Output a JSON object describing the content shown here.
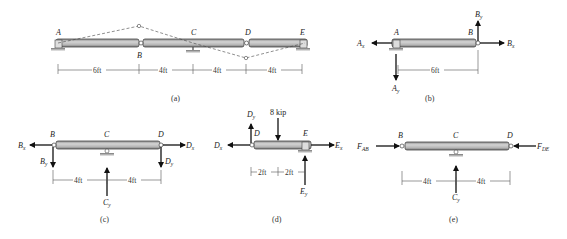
{
  "panels": {
    "a": {
      "caption": "(a)",
      "points": [
        "A",
        "B",
        "C",
        "D",
        "E"
      ],
      "spans": [
        "6ft",
        "4ft",
        "4ft",
        "4ft"
      ]
    },
    "b": {
      "caption": "(b)",
      "points": [
        "A",
        "B"
      ],
      "forces": {
        "Ax": "A",
        "Ax_sub": "x",
        "Ay": "A",
        "Ay_sub": "y",
        "Bx": "B",
        "Bx_sub": "x",
        "By": "B",
        "By_sub": "y"
      },
      "spans": [
        "6ft"
      ]
    },
    "c": {
      "caption": "(c)",
      "points": [
        "B",
        "C",
        "D"
      ],
      "forces": {
        "Bx": "B",
        "Bx_sub": "x",
        "By": "B",
        "By_sub": "y",
        "Cy": "C",
        "Cy_sub": "y",
        "Dx": "D",
        "Dx_sub": "x",
        "Dy": "D",
        "Dy_sub": "y"
      },
      "spans": [
        "4ft",
        "4ft"
      ]
    },
    "d": {
      "caption": "(d)",
      "points": [
        "D",
        "E"
      ],
      "load": "8 kip",
      "forces": {
        "Dx": "D",
        "Dx_sub": "x",
        "Dy": "D",
        "Dy_sub": "y",
        "Ex": "E",
        "Ex_sub": "x",
        "Ey": "E",
        "Ey_sub": "y"
      },
      "spans": [
        "2ft",
        "2ft"
      ]
    },
    "e": {
      "caption": "(e)",
      "points": [
        "B",
        "C",
        "D"
      ],
      "forces": {
        "FAB": "F",
        "FAB_sub": "AB",
        "FDE": "F",
        "FDE_sub": "DE",
        "Cy": "C",
        "Cy_sub": "y"
      },
      "spans": [
        "4ft",
        "4ft"
      ]
    }
  }
}
